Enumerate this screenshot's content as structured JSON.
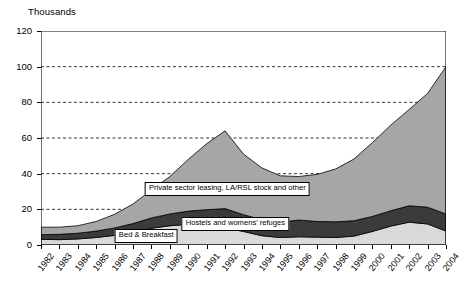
{
  "chart_data": {
    "type": "area",
    "stacked": true,
    "title": "",
    "ylabel": "Thousands",
    "xlabel": "",
    "ylim": [
      0,
      120
    ],
    "ytick_step": 20,
    "yticks": [
      0,
      20,
      40,
      60,
      80,
      100,
      120
    ],
    "grid": "horizontal-dashed",
    "legend_position": "inline-annotations",
    "categories": [
      "1982",
      "1983",
      "1984",
      "1985",
      "1986",
      "1987",
      "1988",
      "1989",
      "1990",
      "1991",
      "1992",
      "1993",
      "1994",
      "1995",
      "1996",
      "1997",
      "1998",
      "1999",
      "2000",
      "2001",
      "2002",
      "2003",
      "2004"
    ],
    "series": [
      {
        "name": "Bed & Breakfast",
        "color": "#d9d9d9",
        "values": [
          3.2,
          3.0,
          3.4,
          4.2,
          5.4,
          7.0,
          9.4,
          10.8,
          11.6,
          11.2,
          9.6,
          7.6,
          5.2,
          4.2,
          4.6,
          4.4,
          4.2,
          5.0,
          7.6,
          10.6,
          12.8,
          11.8,
          7.8
        ]
      },
      {
        "name": "Hostels and womens' refuges",
        "color": "#3b3b3b",
        "values": [
          2.6,
          3.0,
          3.2,
          3.6,
          4.2,
          5.0,
          5.8,
          6.6,
          7.4,
          8.6,
          10.8,
          9.4,
          9.0,
          8.6,
          9.4,
          8.8,
          8.8,
          8.6,
          8.4,
          8.6,
          9.2,
          9.4,
          9.6
        ]
      },
      {
        "name": "Private sector leasing, LA/RSL stock and other",
        "color": "#a6a6a6",
        "values": [
          4.2,
          4.0,
          4.2,
          5.4,
          7.6,
          11.0,
          15.6,
          21.0,
          29.0,
          37.0,
          43.6,
          34.0,
          29.0,
          26.0,
          24.4,
          26.4,
          29.6,
          34.6,
          41.4,
          48.0,
          54.0,
          63.8,
          82.6
        ]
      }
    ],
    "totals": [
      10.0,
      10.0,
      10.8,
      13.2,
      17.2,
      23.0,
      30.8,
      38.4,
      48.0,
      56.8,
      64.0,
      51.0,
      43.2,
      38.8,
      38.4,
      39.6,
      42.6,
      48.2,
      57.4,
      67.2,
      76.0,
      85.0,
      100.0
    ],
    "annotations": [
      {
        "text": "Private sector leasing, LA/RSL stock and other",
        "x_pct": 46.0,
        "y_px": 182
      },
      {
        "text": "Hostels and womens' refuges",
        "x_pct": 48.0,
        "y_px": 217
      },
      {
        "text": "Bed & Breakfast",
        "x_pct": 26.0,
        "y_px": 229
      }
    ]
  },
  "colors": {
    "band_bottom": "#d9d9d9",
    "band_middle": "#3b3b3b",
    "band_top": "#a6a6a6",
    "axis": "#000000",
    "grid": "#000000",
    "background": "#ffffff"
  }
}
